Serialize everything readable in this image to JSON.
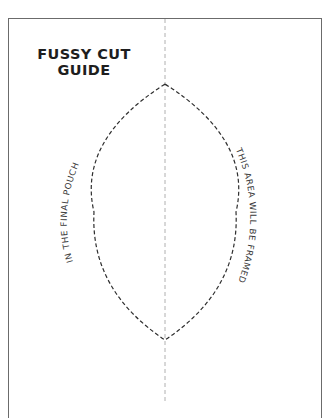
{
  "title": {
    "line1": "FUSSY CUT",
    "line2": "GUIDE"
  },
  "labels": {
    "left_arc": "IN THE FINAL POUCH",
    "right_arc": "THIS AREA WILL BE FRAMED"
  },
  "colors": {
    "frame": "#6b6b6b",
    "cut_line": "#2e2e2e",
    "center_line": "#b0b0b0",
    "text": "#1e1e1e"
  }
}
